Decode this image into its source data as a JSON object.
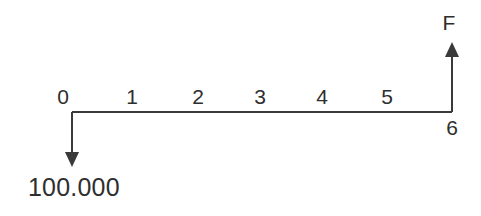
{
  "diagram": {
    "type": "cash-flow-timeline",
    "title": "",
    "line_color": "#3a3a3a",
    "text_color": "#2e2e2e",
    "background_color": "#ffffff",
    "axis": {
      "start_x": 72,
      "end_x": 452,
      "y": 112
    },
    "period_labels": [
      {
        "text": "0",
        "x": 63,
        "y": 86
      },
      {
        "text": "1",
        "x": 132,
        "y": 86
      },
      {
        "text": "2",
        "x": 198,
        "y": 86
      },
      {
        "text": "3",
        "x": 260,
        "y": 86
      },
      {
        "text": "4",
        "x": 322,
        "y": 86
      },
      {
        "text": "5",
        "x": 387,
        "y": 86
      }
    ],
    "end_label": {
      "text": "6",
      "x": 452,
      "y": 117
    },
    "outflow": {
      "label": "100.000",
      "label_x": 28,
      "label_y": 175,
      "arrow_x": 72,
      "arrow_from_y": 112,
      "arrow_to_y": 167,
      "direction": "down",
      "period": "0"
    },
    "inflow": {
      "label": "F",
      "label_x": 449,
      "label_y": 12,
      "arrow_x": 452,
      "arrow_from_y": 112,
      "arrow_to_y": 42,
      "direction": "up",
      "period": "6"
    }
  },
  "chart_data": {
    "type": "bar",
    "xlabel": "",
    "ylabel": "",
    "categories": [
      "0",
      "1",
      "2",
      "3",
      "4",
      "5",
      "6"
    ],
    "values": [
      -100000,
      0,
      0,
      0,
      0,
      0,
      null
    ],
    "annotations": [
      "100.000",
      "F"
    ]
  }
}
